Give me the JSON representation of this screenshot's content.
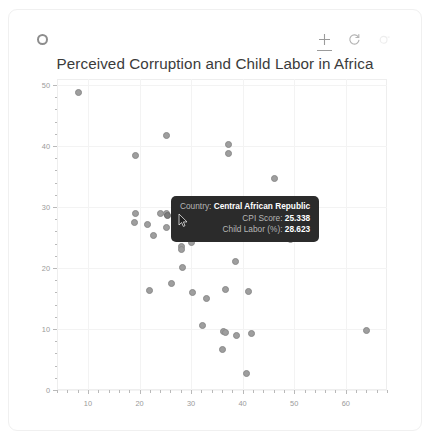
{
  "toolbar": {
    "logo_icon": "bokeh-logo-icon",
    "tools": [
      {
        "name": "pan-tool",
        "icon": "crosshair-move-icon",
        "active": true
      },
      {
        "name": "reset-tool",
        "icon": "reset-circular-arrow-icon",
        "active": false
      },
      {
        "name": "help-tool",
        "icon": "help-dot-icon",
        "active": false
      }
    ]
  },
  "chart_data": {
    "type": "scatter",
    "title": "Perceived Corruption and Child Labor in Africa",
    "xlabel": "",
    "ylabel": "",
    "xlim": [
      4,
      68
    ],
    "ylim": [
      0,
      51
    ],
    "grid": true,
    "legend": null,
    "xticks": [
      10,
      20,
      30,
      40,
      50,
      60
    ],
    "yticks": [
      0,
      10,
      20,
      30,
      40,
      50
    ],
    "series": [
      {
        "name": "African countries",
        "x_name": "CPI Score",
        "y_name": "Child Labor (%)",
        "points": [
          {
            "x": 8.2,
            "y": 48.8
          },
          {
            "x": 25.2,
            "y": 41.8
          },
          {
            "x": 19.3,
            "y": 38.4
          },
          {
            "x": 37.3,
            "y": 40.3
          },
          {
            "x": 37.3,
            "y": 38.8
          },
          {
            "x": 46.1,
            "y": 34.7
          },
          {
            "x": 19.2,
            "y": 28.9
          },
          {
            "x": 19.0,
            "y": 27.4
          },
          {
            "x": 21.5,
            "y": 27.2
          },
          {
            "x": 24.0,
            "y": 29.0
          },
          {
            "x": 25.3,
            "y": 29.0
          },
          {
            "x": 25.3,
            "y": 26.7
          },
          {
            "x": 22.8,
            "y": 25.4
          },
          {
            "x": 28.2,
            "y": 24.8
          },
          {
            "x": 28.2,
            "y": 23.6
          },
          {
            "x": 28.2,
            "y": 23.0
          },
          {
            "x": 30.0,
            "y": 24.2
          },
          {
            "x": 38.6,
            "y": 21.0
          },
          {
            "x": 49.3,
            "y": 24.7
          },
          {
            "x": 28.4,
            "y": 20.1
          },
          {
            "x": 26.3,
            "y": 17.4
          },
          {
            "x": 22.0,
            "y": 16.3
          },
          {
            "x": 30.3,
            "y": 16.0
          },
          {
            "x": 33.0,
            "y": 15.0
          },
          {
            "x": 36.6,
            "y": 16.5
          },
          {
            "x": 41.2,
            "y": 16.2
          },
          {
            "x": 32.2,
            "y": 10.6
          },
          {
            "x": 36.3,
            "y": 9.6
          },
          {
            "x": 36.7,
            "y": 9.5
          },
          {
            "x": 38.9,
            "y": 9.0
          },
          {
            "x": 41.8,
            "y": 9.2
          },
          {
            "x": 64.0,
            "y": 9.8
          },
          {
            "x": 36.1,
            "y": 6.6
          },
          {
            "x": 40.8,
            "y": 2.7
          },
          {
            "x": 25.338,
            "y": 28.623
          }
        ]
      }
    ]
  },
  "tooltip": {
    "rows": [
      {
        "label": "Country:",
        "value": "Central African Republic"
      },
      {
        "label": "CPI Score:",
        "value": "25.338"
      },
      {
        "label": "Child Labor (%):",
        "value": "28.623"
      }
    ]
  }
}
